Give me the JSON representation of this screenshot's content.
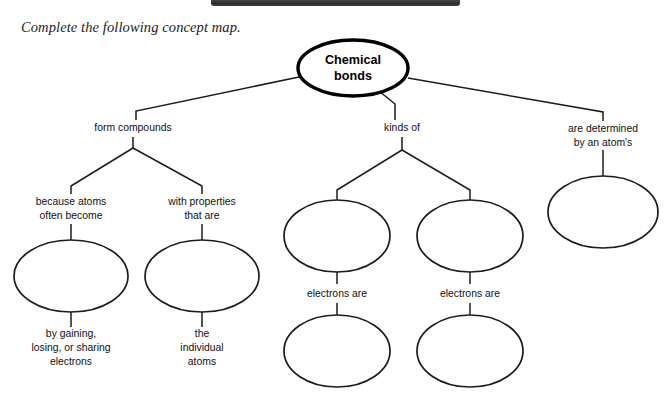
{
  "page": {
    "instruction": "Complete the following concept map.",
    "topbar_color": "#2c2c2c",
    "background_color": "#ffffff",
    "line_color": "#1c1c1c"
  },
  "diagram": {
    "type": "concept-map",
    "root": {
      "label_line1": "Chemical",
      "label_line2": "bonds",
      "shape": "ellipse",
      "cx": 353,
      "cy": 68,
      "rx": 55,
      "ry": 28
    },
    "branches": [
      {
        "name": "form-compounds",
        "label": "form compounds",
        "children": [
          {
            "name": "because-atoms-often-become",
            "label_lines": [
              "because atoms",
              "often become"
            ],
            "blank": true,
            "below_lines": [
              "by gaining,",
              "losing, or sharing",
              "electrons"
            ]
          },
          {
            "name": "with-properties-that-are",
            "label_lines": [
              "with properties",
              "that are"
            ],
            "blank": true,
            "below_lines": [
              "the",
              "individual",
              "atoms"
            ]
          }
        ]
      },
      {
        "name": "kinds-of",
        "label": "kinds of",
        "children": [
          {
            "name": "kind-left",
            "blank": true,
            "connector_label": "electrons are",
            "blank2": true
          },
          {
            "name": "kind-right",
            "blank": true,
            "connector_label": "electrons are",
            "blank2": true
          }
        ]
      },
      {
        "name": "are-determined-by-an-atoms",
        "label_lines": [
          "are determined",
          "by an atom's"
        ],
        "children": [
          {
            "name": "atom-property",
            "blank": true
          }
        ]
      }
    ],
    "blank_ellipse_count": 7,
    "labels": {
      "form_compounds": "form compounds",
      "kinds_of": "kinds of",
      "are_determined_1": "are determined",
      "are_determined_2": "by an atom's",
      "because_atoms_1": "because atoms",
      "because_atoms_2": "often become",
      "with_properties_1": "with properties",
      "with_properties_2": "that are",
      "by_gaining_1": "by gaining,",
      "by_gaining_2": "losing, or sharing",
      "by_gaining_3": "electrons",
      "the_individual_1": "the",
      "the_individual_2": "individual",
      "the_individual_3": "atoms",
      "electrons_are_left": "electrons are",
      "electrons_are_right": "electrons are",
      "root_1": "Chemical",
      "root_2": "bonds"
    }
  }
}
